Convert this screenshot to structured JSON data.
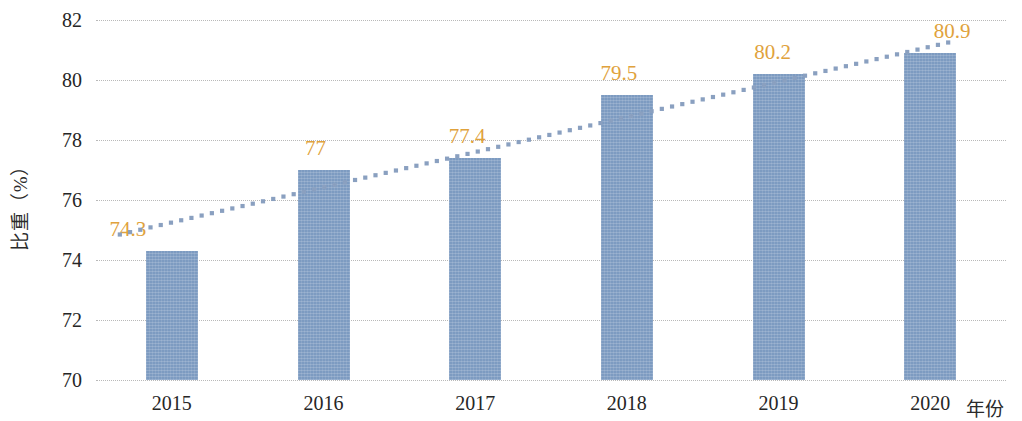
{
  "chart_data": {
    "type": "bar",
    "title": "",
    "subtitle": "",
    "xlabel": "年份",
    "ylabel": "比重（%）",
    "categories": [
      "2015",
      "2016",
      "2017",
      "2018",
      "2019",
      "2020"
    ],
    "values": [
      74.3,
      77,
      77.4,
      79.5,
      80.2,
      80.9
    ],
    "value_labels": [
      "74.3",
      "77",
      "77.4",
      "79.5",
      "80.2",
      "80.9"
    ],
    "ylim": [
      70,
      82
    ],
    "ytick_labels": [
      "82",
      "80",
      "78",
      "76",
      "74",
      "72",
      "70"
    ],
    "ytick_values": [
      82,
      80,
      78,
      76,
      74,
      72,
      70
    ],
    "grid": true,
    "legend": "none",
    "series": [
      {
        "name": "比重",
        "type": "bar",
        "values": [
          74.3,
          77,
          77.4,
          79.5,
          80.2,
          80.9
        ],
        "color": "#7d9bc1"
      },
      {
        "name": "趋势线",
        "type": "line",
        "style": "dotted",
        "color": "#8aa0c0",
        "start_value": 74.85,
        "end_value": 81.25
      }
    ],
    "colors": {
      "bar": "#7d9bc1",
      "data_label": "#e0a23c",
      "trendline": "#8aa0c0",
      "gridline": "#b9b9b9",
      "axis_text": "#262626",
      "background": "#ffffff"
    }
  }
}
